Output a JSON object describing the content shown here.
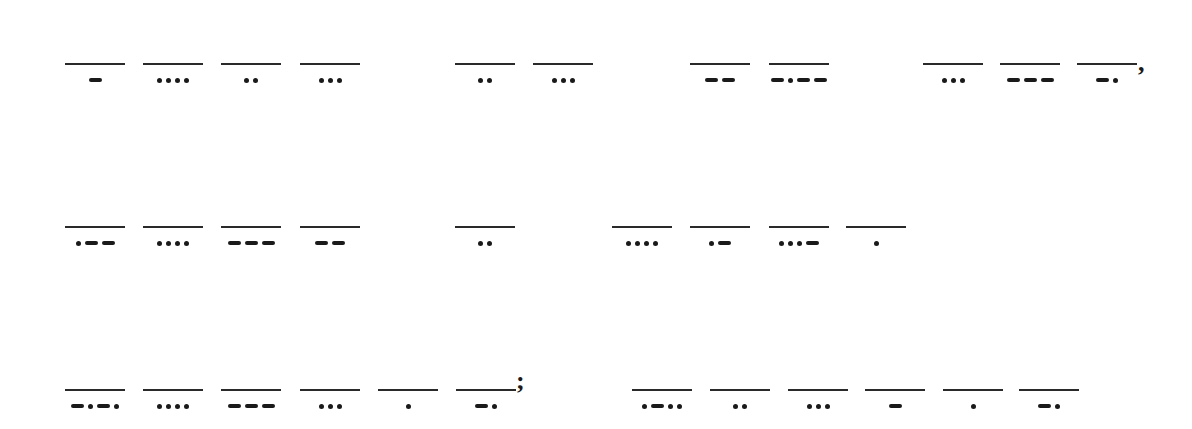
{
  "decoded_text": "THIS IS MY SON, WHOM I HAVE CHOSEN; LISTEN",
  "lines": [
    {
      "y": 63,
      "words": [
        {
          "letters": [
            {
              "x": 65,
              "morse": "-",
              "letter": "T"
            },
            {
              "x": 143,
              "morse": "....",
              "letter": "H"
            },
            {
              "x": 221,
              "morse": "..",
              "letter": "I"
            },
            {
              "x": 300,
              "morse": "...",
              "letter": "S"
            }
          ]
        },
        {
          "letters": [
            {
              "x": 455,
              "morse": "..",
              "letter": "I"
            },
            {
              "x": 533,
              "morse": "...",
              "letter": "S"
            }
          ]
        },
        {
          "letters": [
            {
              "x": 690,
              "morse": "--",
              "letter": "M"
            },
            {
              "x": 769,
              "morse": "-.--",
              "letter": "Y"
            }
          ]
        },
        {
          "letters": [
            {
              "x": 923,
              "morse": "...",
              "letter": "S"
            },
            {
              "x": 1000,
              "morse": "---",
              "letter": "O"
            },
            {
              "x": 1077,
              "morse": "-.",
              "letter": "N"
            }
          ],
          "punct": ",",
          "punct_x": 1138,
          "punct_y": 50
        }
      ]
    },
    {
      "y": 226,
      "words": [
        {
          "letters": [
            {
              "x": 65,
              "morse": ".--",
              "letter": "W"
            },
            {
              "x": 143,
              "morse": "....",
              "letter": "H"
            },
            {
              "x": 221,
              "morse": "---",
              "letter": "O"
            },
            {
              "x": 300,
              "morse": "--",
              "letter": "M"
            }
          ]
        },
        {
          "letters": [
            {
              "x": 455,
              "morse": "..",
              "letter": "I"
            }
          ]
        },
        {
          "letters": [
            {
              "x": 612,
              "morse": "....",
              "letter": "H"
            },
            {
              "x": 690,
              "morse": ".-",
              "letter": "A"
            },
            {
              "x": 769,
              "morse": "...-",
              "letter": "V"
            },
            {
              "x": 846,
              "morse": ".",
              "letter": "E"
            }
          ]
        }
      ]
    },
    {
      "y": 389,
      "words": [
        {
          "letters": [
            {
              "x": 65,
              "morse": "-.-.",
              "letter": "C"
            },
            {
              "x": 143,
              "morse": "....",
              "letter": "H"
            },
            {
              "x": 221,
              "morse": "---",
              "letter": "O"
            },
            {
              "x": 300,
              "morse": "...",
              "letter": "S"
            },
            {
              "x": 378,
              "morse": ".",
              "letter": "E"
            },
            {
              "x": 456,
              "morse": "-.",
              "letter": "N"
            }
          ],
          "punct": ";",
          "punct_x": 516,
          "punct_y": 368
        },
        {
          "letters": [
            {
              "x": 632,
              "morse": ".-..",
              "letter": "L"
            },
            {
              "x": 710,
              "morse": "..",
              "letter": "I"
            },
            {
              "x": 788,
              "morse": "...",
              "letter": "S"
            },
            {
              "x": 865,
              "morse": "-",
              "letter": "T"
            },
            {
              "x": 943,
              "morse": ".",
              "letter": "E"
            },
            {
              "x": 1019,
              "morse": "-.",
              "letter": "N"
            }
          ]
        }
      ]
    }
  ]
}
